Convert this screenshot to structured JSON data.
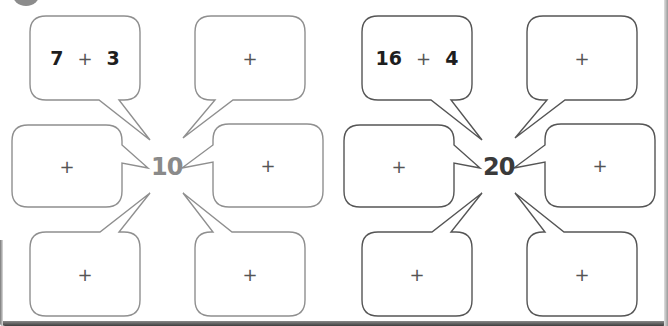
{
  "worksheet": {
    "exercise_badge": "circle-badge",
    "clusters": [
      {
        "center_number": "10",
        "center_color": "#8a8a8a",
        "stroke_color": "#8f8f8f",
        "bubbles": [
          {
            "position": "top-left",
            "left": "7",
            "operator": "+",
            "right": "3"
          },
          {
            "position": "top-right",
            "left": "",
            "operator": "+",
            "right": ""
          },
          {
            "position": "left",
            "left": "",
            "operator": "+",
            "right": ""
          },
          {
            "position": "right",
            "left": "",
            "operator": "+",
            "right": ""
          },
          {
            "position": "bottom-left",
            "left": "",
            "operator": "+",
            "right": ""
          },
          {
            "position": "bottom-right",
            "left": "",
            "operator": "+",
            "right": ""
          }
        ]
      },
      {
        "center_number": "20",
        "center_color": "#3a3a3a",
        "stroke_color": "#555555",
        "bubbles": [
          {
            "position": "top-left",
            "left": "16",
            "operator": "+",
            "right": "4"
          },
          {
            "position": "top-right",
            "left": "",
            "operator": "+",
            "right": ""
          },
          {
            "position": "left",
            "left": "",
            "operator": "+",
            "right": ""
          },
          {
            "position": "right",
            "left": "",
            "operator": "+",
            "right": ""
          },
          {
            "position": "bottom-left",
            "left": "",
            "operator": "+",
            "right": ""
          },
          {
            "position": "bottom-right",
            "left": "",
            "operator": "+",
            "right": ""
          }
        ]
      }
    ]
  }
}
